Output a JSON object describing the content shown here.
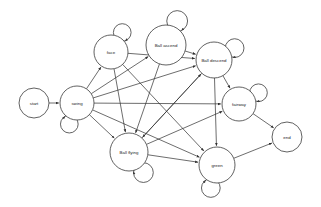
{
  "diagram": {
    "type": "directed-state-graph",
    "background_color": "#ffffff",
    "stroke_color": "#3a3a3a",
    "edge_color": "#2e2e2e",
    "label_color": "#1b1b1b",
    "width": 321,
    "height": 207,
    "nodes": [
      {
        "id": "start",
        "label": "start",
        "cx": 34,
        "cy": 103,
        "r": 15,
        "self_loop": false,
        "loop_angle": 0
      },
      {
        "id": "swing",
        "label": "swing",
        "cx": 77,
        "cy": 103,
        "r": 17,
        "self_loop": true,
        "loop_angle": 110
      },
      {
        "id": "face",
        "label": "face",
        "cx": 111,
        "cy": 52,
        "r": 17,
        "self_loop": true,
        "loop_angle": 300
      },
      {
        "id": "ball_ascend",
        "label": "Ball ascend",
        "cx": 166,
        "cy": 45,
        "r": 20,
        "self_loop": true,
        "loop_angle": 295
      },
      {
        "id": "ball_descend",
        "label": "Ball descend",
        "cx": 214,
        "cy": 60,
        "r": 18,
        "self_loop": true,
        "loop_angle": 330
      },
      {
        "id": "fairway",
        "label": "fairway",
        "cx": 239,
        "cy": 104,
        "r": 17,
        "self_loop": true,
        "loop_angle": 330
      },
      {
        "id": "end",
        "label": "end",
        "cx": 287,
        "cy": 137,
        "r": 15,
        "self_loop": false,
        "loop_angle": 0
      },
      {
        "id": "green",
        "label": "green",
        "cx": 217,
        "cy": 165,
        "r": 18,
        "self_loop": true,
        "loop_angle": 105
      },
      {
        "id": "ball_flying",
        "label": "Ball flying",
        "cx": 129,
        "cy": 152,
        "r": 19,
        "self_loop": true,
        "loop_angle": 55
      }
    ],
    "edges": [
      {
        "from": "start",
        "to": "swing",
        "arrow": true
      },
      {
        "from": "swing",
        "to": "face",
        "arrow": true
      },
      {
        "from": "swing",
        "to": "ball_ascend",
        "arrow": true
      },
      {
        "from": "swing",
        "to": "ball_descend",
        "arrow": true
      },
      {
        "from": "swing",
        "to": "ball_flying",
        "arrow": true
      },
      {
        "from": "swing",
        "to": "green",
        "arrow": true
      },
      {
        "from": "swing",
        "to": "fairway",
        "arrow": true
      },
      {
        "from": "face",
        "to": "ball_descend",
        "arrow": true
      },
      {
        "from": "face",
        "to": "ball_flying",
        "arrow": true
      },
      {
        "from": "face",
        "to": "green",
        "arrow": true
      },
      {
        "from": "ball_ascend",
        "to": "ball_flying",
        "arrow": true
      },
      {
        "from": "ball_ascend",
        "to": "ball_descend",
        "arrow": true
      },
      {
        "from": "ball_descend",
        "to": "ball_flying",
        "arrow": true
      },
      {
        "from": "ball_descend",
        "to": "green",
        "arrow": true
      },
      {
        "from": "ball_descend",
        "to": "fairway",
        "arrow": true
      },
      {
        "from": "ball_flying",
        "to": "ball_descend",
        "arrow": true
      },
      {
        "from": "ball_flying",
        "to": "fairway",
        "arrow": true
      },
      {
        "from": "ball_flying",
        "to": "green",
        "arrow": true
      },
      {
        "from": "fairway",
        "to": "end",
        "arrow": true
      },
      {
        "from": "green",
        "to": "end",
        "arrow": true
      }
    ]
  }
}
